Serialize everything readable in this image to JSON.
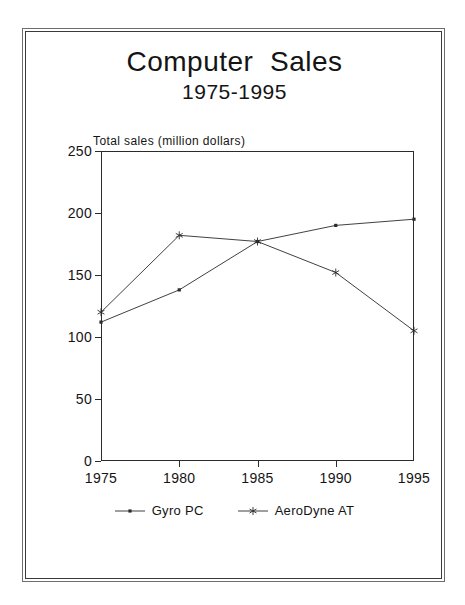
{
  "chart_data": {
    "type": "line",
    "title": "Computer  Sales",
    "subtitle": "1975-1995",
    "xlabel": "",
    "ylabel": "Total sales (million dollars)",
    "categories": [
      "1975",
      "1980",
      "1985",
      "1990",
      "1995"
    ],
    "x": [
      1975,
      1980,
      1985,
      1990,
      1995
    ],
    "xlim": [
      1975,
      1995
    ],
    "ylim": [
      0,
      250
    ],
    "yticks": [
      "0",
      "50",
      "100",
      "150",
      "200",
      "250"
    ],
    "ytick_values": [
      0,
      50,
      100,
      150,
      200,
      250
    ],
    "grid": false,
    "legend_position": "bottom",
    "series": [
      {
        "name": "Gyro PC",
        "marker": "dot",
        "values": [
          112,
          138,
          177,
          190,
          195
        ]
      },
      {
        "name": "AeroDyne AT",
        "marker": "asterisk",
        "values": [
          120,
          182,
          177,
          152,
          105
        ]
      }
    ]
  },
  "colors": {
    "line": "#2b2b2b",
    "frame": "#3a3a3a",
    "text": "#141414",
    "background": "#ffffff"
  }
}
